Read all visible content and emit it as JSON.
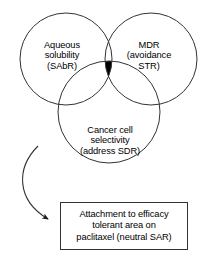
{
  "diagram": {
    "type": "venn-three-circle-with-callout",
    "background_color": "#ffffff",
    "stroke_color": "#333333",
    "intersection_fill_color": "#000000",
    "circles": [
      {
        "id": "aqueous-solubility",
        "label": "Aqueous\nsolubility\n(SAbR)",
        "position": "top-left"
      },
      {
        "id": "mdr-avoidance",
        "label": "MDR\n(avoidance\nSTR)",
        "position": "top-right"
      },
      {
        "id": "cancer-cell-selectivity",
        "label": "Cancer cell\nselectivity\n(address SDR)",
        "position": "bottom-center"
      }
    ],
    "center_intersection": {
      "name": "triple-overlap-region",
      "fill": "#000000",
      "label": ""
    },
    "arrow": {
      "name": "curved-arrow",
      "from": "venn-diagram",
      "to": "outcome-box",
      "style": "curved-with-arrowhead"
    },
    "outcome_box": {
      "text": "Attachment to efficacy\ntolerant area on\npaclitaxel (neutral SAR)"
    }
  }
}
